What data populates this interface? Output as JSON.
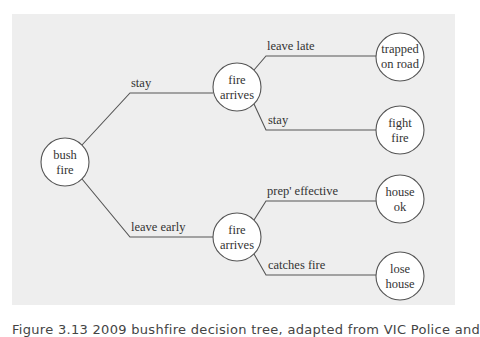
{
  "diagram": {
    "type": "decision-tree",
    "colors": {
      "panel_bg": "#eeeeee",
      "stroke": "#555555",
      "node_fill": "#ffffff",
      "text": "#333333"
    },
    "nodes": {
      "root": {
        "line1": "bush",
        "line2": "fire"
      },
      "fire_after_stay": {
        "line1": "fire",
        "line2": "arrives"
      },
      "fire_after_leave": {
        "line1": "fire",
        "line2": "arrives"
      },
      "trapped": {
        "line1": "trapped",
        "line2": "on road"
      },
      "fight": {
        "line1": "fight",
        "line2": "fire"
      },
      "house_ok": {
        "line1": "house",
        "line2": "ok"
      },
      "lose_house": {
        "line1": "lose",
        "line2": "house"
      }
    },
    "edges": {
      "stay": "stay",
      "leave_early": "leave early",
      "leave_late": "leave late",
      "stay_fight": "stay",
      "prep_effective": "prep' effective",
      "catches_fire": "catches fire"
    }
  },
  "caption": "Figure 3.13  2009 bushfire decision tree, adapted from VIC Police and"
}
